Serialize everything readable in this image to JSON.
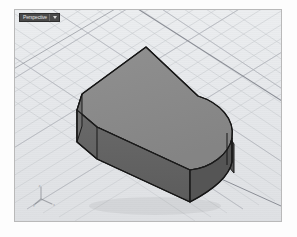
{
  "app": {
    "title": "3D CAD Modeling Viewport",
    "background_color": "#fdfdfd"
  },
  "viewport": {
    "label": "Perspective",
    "has_dropdown_caret": true,
    "tab_background_color": "#4a4a4a",
    "tab_text_color": "#e6e6e6",
    "frame_border_color": "#b9b9b9",
    "background_color": "#e9eaec",
    "display_mode": "Shaded",
    "projection": "Perspective",
    "bounds": {
      "x": 14,
      "y": 9,
      "width": 268,
      "height": 213
    }
  },
  "grid": {
    "visible": true,
    "minor_line_color": "#c9cbd0",
    "major_line_color": "#b3b6bd",
    "axis_line_color": "#8d9099",
    "ground_plane_color": "#e4e6e9"
  },
  "axis_gizmo": {
    "visible": true,
    "position": "bottom-left",
    "axes": [
      "x",
      "y",
      "z"
    ],
    "color": "#7a7d83"
  },
  "model": {
    "name": "rounded-rectangular-solid",
    "object_type": "Polysurface",
    "shading": "shaded",
    "top_face_color": "#8a8a8a",
    "front_face_color": "#616161",
    "side_face_color": "#565656",
    "edge_color": "#1c1c1c",
    "highlight_face_color": "#909090",
    "features": [
      "filleted-right-end",
      "chamfered-left-corner"
    ]
  },
  "icons": {
    "caret": "chevron-down-icon",
    "gizmo": "axis-gizmo-icon"
  }
}
